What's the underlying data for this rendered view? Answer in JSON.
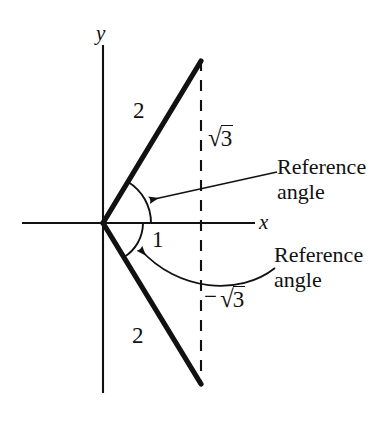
{
  "figure": {
    "type": "geometry-diagram",
    "background_color": "#ffffff",
    "stroke_color": "#111111",
    "axes": {
      "x_axis_label": "x",
      "y_axis_label": "y",
      "origin": {
        "x": 103,
        "y": 223
      },
      "x_axis_start": {
        "x": 22,
        "y": 223
      },
      "x_axis_end": {
        "x": 255,
        "y": 223
      },
      "y_axis_top": {
        "x": 103,
        "y": 45
      },
      "y_axis_bottom": {
        "x": 103,
        "y": 393
      }
    },
    "dashed_line": {
      "x": 201,
      "y_top": 60,
      "y_bottom": 385,
      "style": "dashed"
    },
    "rays": [
      {
        "name": "upper-ray",
        "from": {
          "x": 103,
          "y": 223
        },
        "to": {
          "x": 201,
          "y": 61
        },
        "length_label": "2",
        "label_position": {
          "x": 136,
          "y": 99
        }
      },
      {
        "name": "lower-ray",
        "from": {
          "x": 103,
          "y": 223
        },
        "to": {
          "x": 201,
          "y": 384
        },
        "length_label": "2",
        "label_position": {
          "x": 135,
          "y": 324
        }
      }
    ],
    "arcs": [
      {
        "name": "upper-reference-angle-arc",
        "radius": 48,
        "start_deg": 0,
        "end_deg": 59
      },
      {
        "name": "lower-reference-angle-arc",
        "radius": 40,
        "start_deg": 0,
        "end_deg": -59
      }
    ],
    "labels": {
      "upper_leg": "2",
      "lower_leg": "2",
      "base_leg": "1",
      "upper_vertical_radical_sign": "√",
      "upper_vertical_radicand": "3",
      "lower_vertical_minus": "−",
      "lower_vertical_radical_sign": "√",
      "lower_vertical_radicand": "3",
      "reference_angle_upper_line1": "Reference",
      "reference_angle_upper_line2": "angle",
      "reference_angle_lower_line1": "Reference",
      "reference_angle_lower_line2": "angle"
    },
    "annotations": [
      {
        "name": "upper-reference-angle-pointer",
        "kind": "straight-arrow",
        "from": {
          "x": 277,
          "y": 172
        },
        "to": {
          "x": 146,
          "y": 201
        }
      },
      {
        "name": "lower-reference-angle-pointer",
        "kind": "curved-arrow",
        "from": {
          "x": 275,
          "y": 268
        },
        "to": {
          "x": 136,
          "y": 244
        }
      }
    ]
  }
}
